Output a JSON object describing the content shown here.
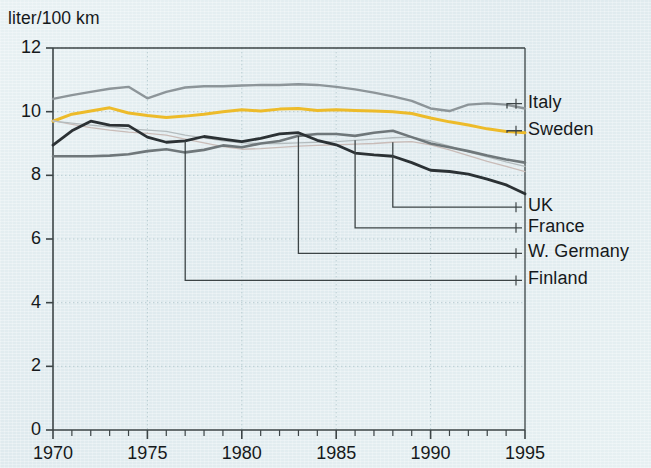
{
  "figure": {
    "axis_title": "liter/100 km",
    "background_color": "#e2edf0",
    "axis_color": "#3c4446",
    "text_color": "#16191b"
  },
  "chart_data": {
    "type": "line",
    "title": "",
    "subtitle": "",
    "xlabel": "",
    "ylabel": "liter/100 km",
    "xlim": [
      1970,
      1995
    ],
    "ylim": [
      0,
      12
    ],
    "xticks": [
      1970,
      1971,
      1972,
      1973,
      1974,
      1975,
      1976,
      1977,
      1978,
      1979,
      1980,
      1981,
      1982,
      1983,
      1984,
      1985,
      1986,
      1987,
      1988,
      1989,
      1990,
      1991,
      1992,
      1993,
      1994,
      1995
    ],
    "xtick_labels": [
      "1970",
      "",
      "",
      "",
      "",
      "1975",
      "",
      "",
      "",
      "",
      "1980",
      "",
      "",
      "",
      "",
      "1985",
      "",
      "",
      "",
      "",
      "1990",
      "",
      "",
      "",
      "",
      "1995"
    ],
    "xtick_labels_major": [
      "1970",
      "1975",
      "1980",
      "1985",
      "1990",
      "1995"
    ],
    "yticks": [
      0,
      2,
      4,
      6,
      8,
      10,
      12
    ],
    "ytick_labels": [
      "0",
      "2",
      "4",
      "6",
      "8",
      "10",
      "12"
    ],
    "grid": "dotted-both-axes",
    "grid_color": "#b9cdd2",
    "legend_position": "right-with-leader-lines",
    "series": [
      {
        "name": "Italy",
        "color": "#8d9599",
        "width": 2.4,
        "x": [
          1970,
          1971,
          1972,
          1973,
          1974,
          1975,
          1976,
          1977,
          1978,
          1979,
          1980,
          1981,
          1982,
          1983,
          1984,
          1985,
          1986,
          1987,
          1988,
          1989,
          1990,
          1991,
          1992,
          1993,
          1994,
          1995
        ],
        "values": [
          10.4,
          10.52,
          10.62,
          10.72,
          10.78,
          10.42,
          10.62,
          10.76,
          10.8,
          10.8,
          10.82,
          10.84,
          10.84,
          10.86,
          10.84,
          10.78,
          10.7,
          10.6,
          10.48,
          10.34,
          10.1,
          10.02,
          10.22,
          10.26,
          10.22,
          10.1
        ],
        "label_y": 10.25
      },
      {
        "name": "Sweden",
        "color": "#edbb2a",
        "width": 3.0,
        "x": [
          1970,
          1971,
          1972,
          1973,
          1974,
          1975,
          1976,
          1977,
          1978,
          1979,
          1980,
          1981,
          1982,
          1983,
          1984,
          1985,
          1986,
          1987,
          1988,
          1989,
          1990,
          1991,
          1992,
          1993,
          1994,
          1995
        ],
        "values": [
          9.7,
          9.92,
          10.02,
          10.12,
          9.96,
          9.88,
          9.82,
          9.86,
          9.92,
          10.0,
          10.06,
          10.02,
          10.08,
          10.1,
          10.04,
          10.06,
          10.04,
          10.02,
          10.0,
          9.94,
          9.8,
          9.68,
          9.58,
          9.46,
          9.38,
          9.34
        ],
        "label_y": 9.4
      },
      {
        "name": "UK",
        "color": "#c9bcb8",
        "width": 1.3,
        "x": [
          1970,
          1971,
          1972,
          1973,
          1974,
          1975,
          1976,
          1977,
          1978,
          1979,
          1980,
          1981,
          1982,
          1983,
          1984,
          1985,
          1986,
          1987,
          1988,
          1989,
          1990,
          1991,
          1992,
          1993,
          1994,
          1995
        ],
        "values": [
          9.72,
          9.6,
          9.5,
          9.42,
          9.36,
          9.32,
          9.26,
          9.14,
          9.02,
          8.9,
          8.82,
          8.84,
          8.88,
          8.92,
          8.94,
          8.96,
          8.98,
          9.0,
          9.04,
          9.06,
          8.96,
          8.8,
          8.62,
          8.44,
          8.28,
          8.12
        ],
        "label_y": 8.12
      },
      {
        "name": "France",
        "color": "#b4bcbe",
        "width": 1.3,
        "x": [
          1970,
          1971,
          1972,
          1973,
          1974,
          1975,
          1976,
          1977,
          1978,
          1979,
          1980,
          1981,
          1982,
          1983,
          1984,
          1985,
          1986,
          1987,
          1988,
          1989,
          1990,
          1991,
          1992,
          1993,
          1994,
          1995
        ],
        "values": [
          9.7,
          9.64,
          9.58,
          9.52,
          9.46,
          9.42,
          9.38,
          9.26,
          9.18,
          9.08,
          9.02,
          9.0,
          9.0,
          9.02,
          9.04,
          9.06,
          9.1,
          9.14,
          9.18,
          9.2,
          9.08,
          8.92,
          8.74,
          8.58,
          8.42,
          8.28
        ],
        "label_y": 8.28
      },
      {
        "name": "W. Germany",
        "color": "#6f777a",
        "width": 2.6,
        "x": [
          1970,
          1971,
          1972,
          1973,
          1974,
          1975,
          1976,
          1977,
          1978,
          1979,
          1980,
          1981,
          1982,
          1983,
          1984,
          1985,
          1986,
          1987,
          1988,
          1989,
          1990,
          1991,
          1992,
          1993,
          1994,
          1995
        ],
        "values": [
          8.6,
          8.6,
          8.6,
          8.62,
          8.66,
          8.76,
          8.82,
          8.72,
          8.8,
          8.94,
          8.88,
          9.0,
          9.08,
          9.24,
          9.3,
          9.3,
          9.24,
          9.34,
          9.4,
          9.2,
          9.0,
          8.88,
          8.76,
          8.62,
          8.5,
          8.4
        ],
        "label_y": 8.4
      },
      {
        "name": "Finland",
        "color": "#2b3134",
        "width": 2.8,
        "x": [
          1970,
          1971,
          1972,
          1973,
          1974,
          1975,
          1976,
          1977,
          1978,
          1979,
          1980,
          1981,
          1982,
          1983,
          1984,
          1985,
          1986,
          1987,
          1988,
          1989,
          1990,
          1991,
          1992,
          1993,
          1994,
          1995
        ],
        "values": [
          8.95,
          9.4,
          9.7,
          9.58,
          9.56,
          9.2,
          9.04,
          9.08,
          9.22,
          9.14,
          9.06,
          9.16,
          9.3,
          9.34,
          9.1,
          8.96,
          8.7,
          8.64,
          8.6,
          8.4,
          8.16,
          8.12,
          8.04,
          7.88,
          7.7,
          7.42
        ],
        "label_y": 7.42
      }
    ]
  },
  "legend": {
    "items": [
      {
        "label": "Italy",
        "anchor_year": 1995,
        "anchor_value": 10.1,
        "label_value": 10.25,
        "color": "#8d9599"
      },
      {
        "label": "Sweden",
        "anchor_year": 1995,
        "anchor_value": 9.34,
        "label_value": 9.4,
        "color": "#edbb2a"
      },
      {
        "label": "UK",
        "anchor_year": 1988,
        "anchor_value": 9.04,
        "label_value": 7.0,
        "color": "#c9bcb8"
      },
      {
        "label": "France",
        "anchor_year": 1986,
        "anchor_value": 9.1,
        "label_value": 6.35,
        "color": "#b4bcbe"
      },
      {
        "label": "W. Germany",
        "anchor_year": 1983,
        "anchor_value": 9.24,
        "label_value": 5.55,
        "color": "#6f777a"
      },
      {
        "label": "Finland",
        "anchor_year": 1977,
        "anchor_value": 9.08,
        "label_value": 4.7,
        "color": "#2b3134"
      }
    ]
  }
}
